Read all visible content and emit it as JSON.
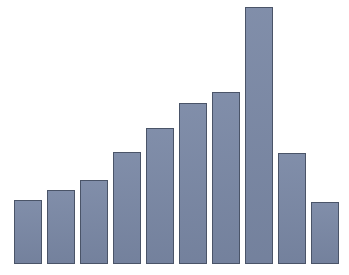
{
  "figure": {
    "background_color": "#ffffff",
    "width": 349,
    "height": 275
  },
  "caption": {
    "text": ""
  },
  "style": {
    "bar_fill_color": "#7a88a5",
    "bar_edge_color": "#4a5468",
    "bar_edge_width": 1
  },
  "chart_data": {
    "type": "bar",
    "title": "",
    "subtitle": "",
    "xlabel": "",
    "ylabel": "",
    "categories": [
      "1",
      "2",
      "3",
      "4",
      "5",
      "6",
      "7",
      "8",
      "9",
      "10"
    ],
    "values": [
      64,
      74,
      84,
      112,
      136,
      161,
      172,
      257,
      111,
      62
    ],
    "ylim": [
      0,
      264
    ],
    "xlim": [
      0,
      349
    ],
    "grid": false,
    "legend": null,
    "legend_position": "none",
    "xtick_labels": [],
    "ytick_labels": [],
    "annotations": [],
    "geometry": {
      "baseline_y": 264,
      "bar_width": 28,
      "bar_pitch": 33,
      "first_bar_left": 14,
      "bar_tops": [
        200,
        190,
        180,
        152,
        128,
        103,
        92,
        7,
        153,
        202
      ]
    }
  }
}
